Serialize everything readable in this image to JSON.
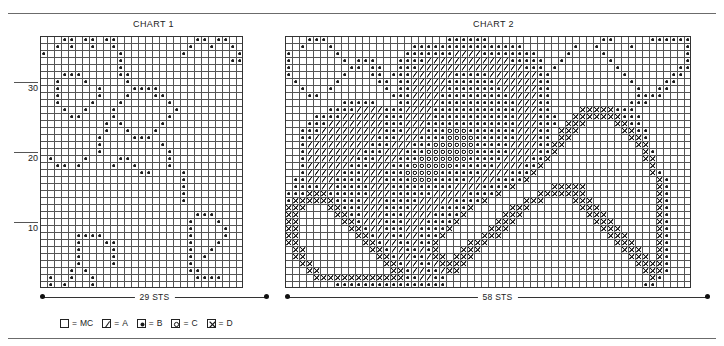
{
  "page": {
    "kind": "knitting-colorwork-chart-sheet"
  },
  "charts": [
    {
      "id": "chart1",
      "title": "CHART 1",
      "stitch_label": "29 STS",
      "columns": 29,
      "rows": 36,
      "row_axis_labels": [
        "10",
        "20",
        "30"
      ],
      "row_axis_values": [
        10,
        20,
        30
      ]
    },
    {
      "id": "chart2",
      "title": "CHART 2",
      "stitch_label": "58 STS",
      "columns": 58,
      "rows": 36,
      "row_axis_labels": [],
      "row_axis_values": []
    }
  ],
  "legend": {
    "items": [
      {
        "symbol": "blank",
        "symbol_name": "empty-square-symbol",
        "equals": "=",
        "label": "MC"
      },
      {
        "symbol": "slash",
        "symbol_name": "slash-symbol",
        "equals": "=",
        "label": "A"
      },
      {
        "symbol": "dot",
        "symbol_name": "filled-dot-symbol",
        "equals": "=",
        "label": "B"
      },
      {
        "symbol": "circle",
        "symbol_name": "open-circle-symbol",
        "equals": "=",
        "label": "C"
      },
      {
        "symbol": "cross",
        "symbol_name": "cross-x-symbol",
        "equals": "=",
        "label": "D"
      }
    ]
  },
  "colors": {
    "ink": "#1a1a1a",
    "grid_line": "#555555",
    "rule": "#6b6b6b",
    "background": "#ffffff"
  },
  "chart_data": {
    "type": "heatmap",
    "symbol_key": {
      "0": "MC",
      "1": "A",
      "2": "B",
      "3": "C",
      "4": "D"
    },
    "charts": [
      {
        "name": "CHART 1",
        "columns": 29,
        "rows": 36,
        "xlabel": "29 STS",
        "ylabel": "row",
        "note": "rows listed top (row 36) to bottom (row 1); each string has 29 chars",
        "cells": [
          "00022022022000000000002202200",
          "00202002002000000000020020020",
          "20000000000200000000200000002",
          "00000000000200000000000000022",
          "00000000000200000000000000000",
          "00022200000220000000000000000",
          "00200020000020000000000000000",
          "00200000200002222000000000000",
          "00200000200020002200000000000",
          "00200002000200000020000000000",
          "00020020002000000002000000000",
          "00002200002000000020000000000",
          "00000000020200000200000000000",
          "00000000020020002000000000000",
          "00000000200002220000000000000",
          "00000000200000000200000000000",
          "00000000200000000020000000000",
          "02000020000220000020000000000",
          "00220200002002000020000000000",
          "00000000000000220000200000000",
          "00000000000000000000200000000",
          "00000000000000000000200000000",
          "00000000000000000000200000000",
          "00000000000000000000200000000",
          "00000000000000000000000000000",
          "00000000000000000000002220000",
          "00000000000000000000020002000",
          "00000000000000000000020000200",
          "00000222200000000000020000200",
          "00000200022000000000020002000",
          "00000200002000000000020020000",
          "00000200002000000000020200000",
          "00000200002000000000020000000",
          "00002020000000000000022000000",
          "02002002000000000000002222000",
          "02020002000000000000000000000"
        ]
      },
      {
        "name": "CHART 2",
        "columns": 58,
        "rows": 36,
        "xlabel": "58 STS",
        "ylabel": "row",
        "note": "rows listed top (row 36) to bottom (row 1); 0=MC 1=A 2=B 3=C 4=D",
        "cells": [
          "0002220000000000000000022222200000000000000002200000222222",
          "0020002000000000002222222222222222000000020020000200000002",
          "2000000200000000022222221111222222220000200002000000000002",
          "2000000020222000222211111111111122222002000000200000000002",
          "2000000002202200222111111111111111222020000000020000000022",
          "2000000020002202221111112222211111112200000000002000000220",
          "0200000200000220221111122222221111112200000000000200002200",
          "0020002000000020221111122222222111112200000000000020022000",
          "0002200000000002221111222222222211112200000000000022220000",
          "0000000022222000221111222222222221112200000000000222000000",
          "0000002222111122211112222222222221112200004444422200000000",
          "0000222211111122211112222222222221112220044444442220000000",
          "0002221111111122211122222222222221112220444000044220000000",
          "0022211111111122211122233322222221112204440000004422000000",
          "0022111111111222111222233332222221112204400000000442000000",
          "0021111111112221112223333332222211112244000000000044000000",
          "0021111111122211122233333332222211112240000000000004200000",
          "0021111111222111222333333322222111122400000000000004400000",
          "0021111112221112223333332222221111224000000000000000400000",
          "0021111122211122233333222222111122240000000000000000420000",
          "0221111222211122223332222211112222400000000000000000042000",
          "0222211222221112222222221111222240000044444000000000042000",
          "2224442222221112222221111122224000004444444000000000042000",
          "2444444222211122222111112222400000444000044400000000042000",
          "4440004422211122221111222240000044400000004440000000042000",
          "4400000442211122211112222400000444000000000444000000042000",
          "4400000044211122211122224000004440000000000044400000042000",
          "4400000004421122211222240000044400000000000004440000042000",
          "4400000000442112211222400000444000000000000000444000042000",
          "4400000000044211221224000044400000000000000000044400042000",
          "0440000000004421122124000444000000000000000000004440042000",
          "0440000000000442112214404440000000000000000000000444042000",
          "0044000000000044211221444400000000000000000000000044442000",
          "0004400000000004421122144000000000000000000000000004442000",
          "0000444444444444422112200000000000000000000000000000420000",
          "0000000222222222222222200000000000000000000000000002200000"
        ]
      }
    ]
  }
}
